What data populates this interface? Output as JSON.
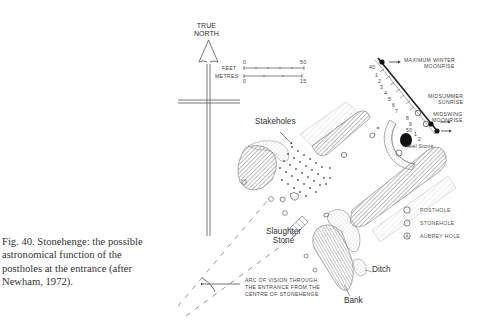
{
  "figure": {
    "caption": "Fig. 40. Stonehenge: the possible astronomical function of the postholes at the entrance (after Newham, 1972)."
  },
  "north_arrow": {
    "line1": "TRUE",
    "line2": "NORTH"
  },
  "scale_bar": {
    "feet_label": "FEET",
    "feet_start": "0",
    "feet_end": "50",
    "metres_label": "METRES",
    "metres_start": "0",
    "metres_end": "15"
  },
  "alignments": {
    "max_winter_moonrise_1": "MAXIMUM WINTER",
    "max_winter_moonrise_2": "MOONRISE",
    "midsummer_sunrise_1": "MIDSUMMER",
    "midsummer_sunrise_2": "SUNRISE",
    "midswing_moonrise_1": "MIDSWING",
    "midswing_moonrise_2": "MOONRISE",
    "row_numbers": [
      "40",
      "1",
      "2",
      "3",
      "4",
      "5",
      "6",
      "7",
      "8",
      "9",
      "50",
      "1",
      "2"
    ]
  },
  "features": {
    "stakeholes": "Stakeholes",
    "heel_stone": "Heel Stone",
    "slaughter_stone_1": "Slaughter",
    "slaughter_stone_2": "Stone",
    "ditch": "Ditch",
    "bank": "Bank"
  },
  "arc_of_vision": {
    "line1": "ARC OF VISION THROUGH",
    "line2": "THE ENTRANCE FROM THE",
    "line3": "CENTRE OF STONEHENGE"
  },
  "legend": [
    {
      "symbol": "posthole",
      "label": "POSTHOLE"
    },
    {
      "symbol": "stonehole",
      "label": "STONEHOLE"
    },
    {
      "symbol": "aubrey-hole",
      "label": "AUBREY HOLE"
    }
  ],
  "colors": {
    "ink": "#333333",
    "hatch": "#8a8a8a",
    "stipple": "#9a9a9a",
    "paper": "#ffffff"
  }
}
